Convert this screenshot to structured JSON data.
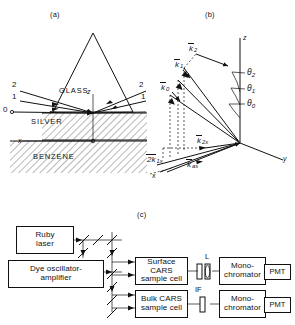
{
  "figure": {
    "panels": [
      {
        "id": "a",
        "label": "(a)"
      },
      {
        "id": "b",
        "label": "(b)"
      },
      {
        "id": "c",
        "label": "(c)"
      }
    ]
  },
  "panel_a": {
    "caption": "(a)",
    "materials": {
      "glass": "GLASS",
      "silver": "SILVER",
      "benzene": "BENZENE"
    },
    "axes": {
      "z": "z",
      "x": "x"
    },
    "beams_left": [
      "2",
      "1",
      "0"
    ],
    "beams_right": [
      "2",
      "1"
    ]
  },
  "panel_b": {
    "caption": "(b)",
    "axes": {
      "z": "z",
      "y": "y",
      "x": "x"
    },
    "wavevectors": {
      "k2": "k",
      "k2_sub": "2",
      "k1": "k",
      "k1_sub": "1",
      "k0": "k",
      "k0_sub": "0",
      "kas": "k",
      "kas_sub": "as",
      "twok1x": "2k",
      "twok1x_sub": "1x",
      "k2x": "k",
      "k2x_sub": "2x"
    },
    "angles": [
      {
        "symbol": "θ",
        "sub": "2"
      },
      {
        "symbol": "θ",
        "sub": "1"
      },
      {
        "symbol": "θ",
        "sub": "0"
      }
    ]
  },
  "panel_c": {
    "caption": "(c)",
    "blocks": [
      {
        "id": "ruby-laser",
        "lines": [
          "Ruby",
          "laser"
        ]
      },
      {
        "id": "dye-oscillator",
        "lines": [
          "Dye oscillator-",
          "amplifier"
        ]
      },
      {
        "id": "surface-cars",
        "lines": [
          "Surface CARS",
          "sample cell"
        ]
      },
      {
        "id": "bulk-cars",
        "lines": [
          "Bulk CARS",
          "sample cell"
        ]
      },
      {
        "id": "monochromator-top",
        "lines": [
          "Mono-",
          "chromator"
        ]
      },
      {
        "id": "monochromator-bot",
        "lines": [
          "Mono-",
          "chromator"
        ]
      },
      {
        "id": "pmt-top",
        "lines": [
          "PMT"
        ]
      },
      {
        "id": "pmt-bot",
        "lines": [
          "PMT"
        ]
      }
    ],
    "optics": {
      "lens": "L",
      "filter": "IF"
    }
  }
}
